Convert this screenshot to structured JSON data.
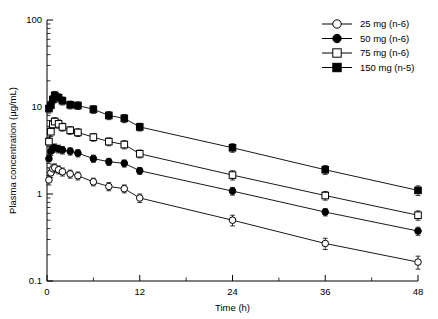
{
  "chart_data": {
    "type": "line",
    "title": "",
    "xlabel": "Time (h)",
    "ylabel": "Plasma concentration (µg/mL)",
    "xlim": [
      0,
      48
    ],
    "ylim": [
      0.1,
      100
    ],
    "yscale": "log",
    "xscale": "linear",
    "grid": false,
    "legend_position": "top-right",
    "xticks": [
      0,
      12,
      24,
      36,
      48
    ],
    "xticklabels": [
      "0",
      "12",
      "24",
      "36",
      "48"
    ],
    "xminorticks": [
      6,
      18,
      30,
      42
    ],
    "yticks": [
      0.1,
      1,
      10,
      100
    ],
    "yticklabels": [
      "0.1",
      "1",
      "10",
      "100"
    ],
    "series": [
      {
        "name": "25 mg (n-6)",
        "marker": "open-circle",
        "n": 6,
        "dose_mg": 25,
        "x": [
          0.25,
          0.5,
          0.75,
          1,
          1.5,
          2,
          3,
          4,
          6,
          8,
          10,
          12,
          24,
          36,
          48
        ],
        "y": [
          1.45,
          1.75,
          1.95,
          2.0,
          1.9,
          1.8,
          1.7,
          1.62,
          1.38,
          1.22,
          1.15,
          0.9,
          0.5,
          0.27,
          0.165
        ],
        "yerr_lo": [
          0.18,
          0.2,
          0.22,
          0.22,
          0.2,
          0.19,
          0.18,
          0.17,
          0.14,
          0.13,
          0.12,
          0.1,
          0.07,
          0.04,
          0.028
        ],
        "yerr_hi": [
          0.18,
          0.2,
          0.22,
          0.22,
          0.2,
          0.19,
          0.18,
          0.17,
          0.14,
          0.13,
          0.12,
          0.1,
          0.07,
          0.04,
          0.028
        ]
      },
      {
        "name": "50 mg (n-6)",
        "marker": "filled-circle",
        "n": 6,
        "dose_mg": 50,
        "x": [
          0.25,
          0.5,
          0.75,
          1,
          1.5,
          2,
          3,
          4,
          6,
          8,
          10,
          12,
          24,
          36,
          48
        ],
        "y": [
          2.55,
          3.1,
          3.35,
          3.4,
          3.3,
          3.2,
          3.1,
          2.95,
          2.55,
          2.35,
          2.25,
          1.85,
          1.08,
          0.62,
          0.375
        ],
        "yerr_lo": [
          0.3,
          0.34,
          0.36,
          0.36,
          0.34,
          0.32,
          0.3,
          0.28,
          0.24,
          0.22,
          0.21,
          0.17,
          0.11,
          0.06,
          0.04
        ],
        "yerr_hi": [
          0.3,
          0.34,
          0.36,
          0.36,
          0.34,
          0.32,
          0.3,
          0.28,
          0.24,
          0.22,
          0.21,
          0.17,
          0.11,
          0.06,
          0.04
        ]
      },
      {
        "name": "75 mg (n-6)",
        "marker": "open-square",
        "n": 6,
        "dose_mg": 75,
        "x": [
          0.25,
          0.5,
          0.75,
          1,
          1.5,
          2,
          3,
          4,
          6,
          8,
          10,
          12,
          24,
          36,
          48
        ],
        "y": [
          4.0,
          5.2,
          6.3,
          6.8,
          6.4,
          5.9,
          5.4,
          5.1,
          4.5,
          4.0,
          3.7,
          2.9,
          1.65,
          0.96,
          0.57
        ],
        "yerr_lo": [
          0.5,
          0.6,
          0.7,
          0.75,
          0.7,
          0.62,
          0.55,
          0.52,
          0.45,
          0.42,
          0.4,
          0.3,
          0.2,
          0.11,
          0.07
        ],
        "yerr_hi": [
          0.5,
          0.6,
          0.7,
          0.75,
          0.7,
          0.62,
          0.55,
          0.52,
          0.45,
          0.42,
          0.4,
          0.3,
          0.2,
          0.11,
          0.07
        ]
      },
      {
        "name": "150 mg (n-5)",
        "marker": "filled-square",
        "n": 5,
        "dose_mg": 150,
        "x": [
          0.25,
          0.5,
          0.75,
          1,
          1.5,
          2,
          3,
          4,
          6,
          8,
          10,
          12,
          24,
          36,
          48
        ],
        "y": [
          9.6,
          10.5,
          12.2,
          13.6,
          12.8,
          11.8,
          10.6,
          10.4,
          9.4,
          8.0,
          7.4,
          5.9,
          3.4,
          1.9,
          1.1
        ],
        "yerr_lo": [
          1.1,
          1.2,
          1.35,
          1.5,
          1.4,
          1.25,
          1.1,
          1.05,
          0.95,
          0.85,
          0.8,
          0.6,
          0.38,
          0.22,
          0.14
        ],
        "yerr_hi": [
          1.1,
          1.2,
          1.35,
          1.5,
          1.4,
          1.25,
          1.1,
          1.05,
          0.95,
          0.85,
          0.8,
          0.6,
          0.38,
          0.22,
          0.14
        ]
      }
    ]
  },
  "legend": {
    "items": [
      {
        "label": "25 mg (n-6)",
        "marker": "open-circle"
      },
      {
        "label": "50 mg (n-6)",
        "marker": "filled-circle"
      },
      {
        "label": "75 mg (n-6)",
        "marker": "open-square"
      },
      {
        "label": "150 mg (n-5)",
        "marker": "filled-square"
      }
    ]
  },
  "colors": {
    "line": "#000000",
    "marker_fill_open": "#ffffff",
    "marker_fill_closed": "#000000",
    "axis": "#000000",
    "background": "#ffffff"
  }
}
